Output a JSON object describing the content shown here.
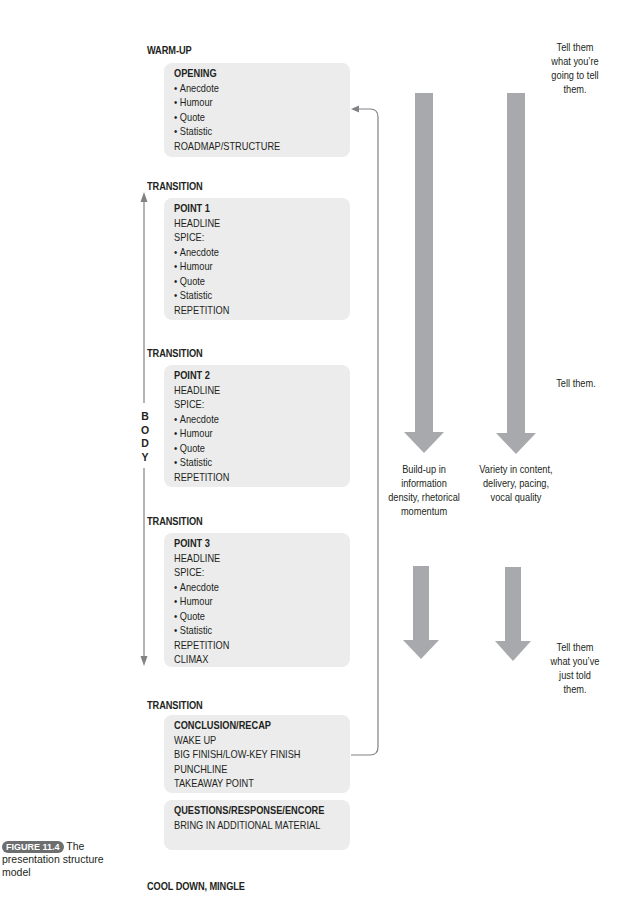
{
  "diagram": {
    "sections": {
      "warm_up": "WARM-UP",
      "transition_1": "TRANSITION",
      "transition_2": "TRANSITION",
      "transition_3": "TRANSITION",
      "transition_4": "TRANSITION",
      "cool_down": "COOL DOWN, MINGLE"
    },
    "boxes": {
      "opening": {
        "title": "OPENING",
        "lines": [
          "Anecdote",
          "Humour",
          "Quote",
          "Statistic"
        ],
        "footer": [
          "ROADMAP/STRUCTURE"
        ]
      },
      "point1": {
        "title": "POINT 1",
        "pre": [
          "HEADLINE",
          "SPICE:"
        ],
        "lines": [
          "Anecdote",
          "Humour",
          "Quote",
          "Statistic"
        ],
        "footer": [
          "REPETITION"
        ]
      },
      "point2": {
        "title": "POINT 2",
        "pre": [
          "HEADLINE",
          "SPICE:"
        ],
        "lines": [
          "Anecdote",
          "Humour",
          "Quote",
          "Statistic"
        ],
        "footer": [
          "REPETITION"
        ]
      },
      "point3": {
        "title": "POINT 3",
        "pre": [
          "HEADLINE",
          "SPICE:"
        ],
        "lines": [
          "Anecdote",
          "Humour",
          "Quote",
          "Statistic"
        ],
        "footer": [
          "REPETITION",
          "CLIMAX"
        ]
      },
      "conclusion": {
        "title": "CONCLUSION/RECAP",
        "pre": [
          "WAKE UP",
          "BIG FINISH/LOW-KEY FINISH",
          "PUNCHLINE",
          "TAKEAWAY POINT"
        ]
      },
      "questions": {
        "title": "QUESTIONS/RESPONSE/ENCORE",
        "pre": [
          "BRING IN ADDITIONAL MATERIAL"
        ]
      }
    },
    "body_label": [
      "B",
      "O",
      "D",
      "Y"
    ],
    "right_notes": {
      "tell_before": [
        "Tell them",
        "what you’re",
        "going to tell",
        "them."
      ],
      "tell": [
        "Tell them."
      ],
      "tell_after": [
        "Tell them",
        "what you’ve",
        "just told",
        "them."
      ]
    },
    "arrow_labels": {
      "buildup": [
        "Build-up in",
        "information",
        "density, rhetorical",
        "momentum"
      ],
      "variety": [
        "Variety in content,",
        "delivery, pacing,",
        "vocal quality"
      ]
    },
    "caption": {
      "badge": "FIGURE 11.4",
      "text": "The presentation structure model"
    },
    "colors": {
      "box_fill": "#ececec",
      "arrow_fill": "#a7a9ac",
      "line": "#808285",
      "text": "#231f20",
      "badge": "#6d6e70"
    }
  }
}
